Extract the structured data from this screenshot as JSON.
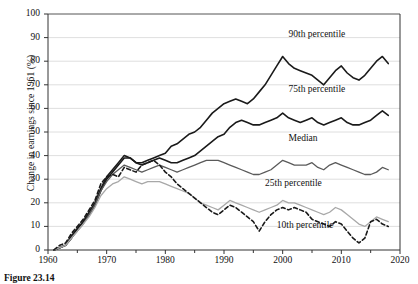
{
  "figure": {
    "caption": "Figure 23.14"
  },
  "chart_data": {
    "type": "line",
    "title": "",
    "xlabel": "",
    "ylabel": "Change in earnings since 1961 (%)",
    "xlim": [
      1960,
      2020
    ],
    "ylim": [
      0,
      100
    ],
    "xticks": [
      1960,
      1970,
      1980,
      1990,
      2000,
      2010,
      2020
    ],
    "yticks": [
      0,
      10,
      20,
      30,
      40,
      50,
      60,
      70,
      80,
      90,
      100
    ],
    "xtick_labels": [
      "1960",
      "1970",
      "1980",
      "1990",
      "2000",
      "2010",
      "2020"
    ],
    "ytick_labels": [
      "0",
      "10",
      "20",
      "30",
      "40",
      "50",
      "60",
      "70",
      "80",
      "90",
      "100"
    ],
    "x_minor_tick_interval": 5,
    "grid": "horizontal",
    "legend": "inline-labels",
    "x": [
      1961,
      1962,
      1963,
      1964,
      1965,
      1966,
      1967,
      1968,
      1969,
      1970,
      1971,
      1972,
      1973,
      1974,
      1975,
      1976,
      1977,
      1978,
      1979,
      1980,
      1981,
      1982,
      1983,
      1984,
      1985,
      1986,
      1987,
      1988,
      1989,
      1990,
      1991,
      1992,
      1993,
      1994,
      1995,
      1996,
      1997,
      1998,
      1999,
      2000,
      2001,
      2002,
      2003,
      2004,
      2005,
      2006,
      2007,
      2008,
      2009,
      2010,
      2011,
      2012,
      2013,
      2014,
      2015,
      2016,
      2017,
      2018
    ],
    "series": [
      {
        "name": "90th percentile",
        "color": "#1a1a1a",
        "style": "solid",
        "width": 1.6,
        "label_x": 2001,
        "label_y": 91,
        "values": [
          0,
          1,
          2,
          6,
          9,
          12,
          15,
          19,
          25,
          30,
          33,
          36,
          39,
          39,
          37,
          37,
          38,
          39,
          40,
          41,
          44,
          45,
          47,
          49,
          50,
          52,
          55,
          58,
          60,
          62,
          63,
          64,
          63,
          62,
          64,
          67,
          70,
          74,
          78,
          82,
          79,
          77,
          76,
          75,
          74,
          72,
          70,
          73,
          76,
          78,
          75,
          73,
          72,
          74,
          77,
          80,
          82,
          79
        ]
      },
      {
        "name": "75th percentile",
        "color": "#1a1a1a",
        "style": "solid",
        "width": 1.6,
        "label_x": 2001,
        "label_y": 68,
        "values": [
          0,
          1,
          2,
          5,
          9,
          12,
          16,
          20,
          26,
          31,
          34,
          37,
          40,
          39,
          37,
          36,
          37,
          38,
          39,
          38,
          37,
          37,
          38,
          39,
          40,
          42,
          44,
          46,
          48,
          49,
          52,
          54,
          55,
          54,
          53,
          53,
          54,
          55,
          56,
          58,
          56,
          55,
          54,
          55,
          56,
          54,
          53,
          54,
          55,
          56,
          54,
          53,
          53,
          54,
          55,
          57,
          59,
          57
        ]
      },
      {
        "name": "Median",
        "color": "#5a5a5a",
        "style": "solid",
        "width": 1.3,
        "label_x": 2001,
        "label_y": 47,
        "values": [
          0,
          1,
          2,
          5,
          8,
          11,
          15,
          19,
          25,
          29,
          32,
          34,
          36,
          35,
          34,
          33,
          34,
          35,
          36,
          35,
          34,
          33,
          34,
          35,
          36,
          37,
          38,
          38,
          38,
          37,
          36,
          35,
          34,
          33,
          32,
          32,
          33,
          34,
          36,
          38,
          37,
          36,
          36,
          36,
          37,
          35,
          34,
          36,
          37,
          36,
          35,
          34,
          33,
          32,
          32,
          33,
          35,
          34
        ]
      },
      {
        "name": "25th percentile",
        "color": "#a8a8a8",
        "style": "solid",
        "width": 1.3,
        "label_x": 1997,
        "label_y": 28,
        "values": [
          0,
          1,
          2,
          5,
          8,
          11,
          14,
          18,
          23,
          26,
          28,
          29,
          31,
          30,
          29,
          28,
          29,
          29,
          29,
          28,
          27,
          26,
          25,
          24,
          22,
          20,
          19,
          18,
          17,
          19,
          21,
          20,
          19,
          18,
          17,
          16,
          17,
          18,
          19,
          21,
          20,
          20,
          19,
          18,
          17,
          16,
          15,
          16,
          18,
          17,
          15,
          13,
          11,
          10,
          12,
          14,
          13,
          12
        ]
      },
      {
        "name": "10th percentile",
        "color": "#1a1a1a",
        "style": "dashed",
        "width": 1.6,
        "label_x": 1999,
        "label_y": 10,
        "values": [
          0,
          2,
          3,
          7,
          10,
          13,
          17,
          21,
          28,
          31,
          32,
          31,
          35,
          34,
          33,
          36,
          37,
          38,
          36,
          33,
          31,
          28,
          26,
          24,
          22,
          20,
          18,
          16,
          15,
          17,
          19,
          18,
          16,
          14,
          12,
          8,
          12,
          15,
          17,
          18,
          17,
          18,
          17,
          16,
          13,
          12,
          11,
          10,
          12,
          11,
          8,
          5,
          3,
          5,
          12,
          13,
          11,
          10
        ]
      }
    ]
  }
}
